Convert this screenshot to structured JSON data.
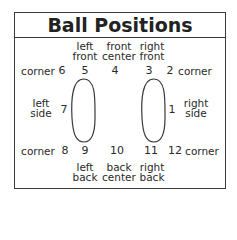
{
  "title": "Ball Positions",
  "top_labels": {
    "left_front": [
      "left",
      "front"
    ],
    "front_center": [
      "front",
      "center"
    ],
    "right_front": [
      "right",
      "front"
    ]
  },
  "bottom_labels": {
    "left_back": [
      "left",
      "back"
    ],
    "back_center": [
      "back",
      "center"
    ],
    "right_back": [
      "right",
      "back"
    ]
  },
  "side_labels": {
    "left_side": [
      "left",
      "side"
    ],
    "right_side": [
      "right",
      "side"
    ]
  },
  "corner_label": "corner",
  "positions": {
    "p1": "1",
    "p2": "2",
    "p3": "3",
    "p4": "4",
    "p5": "5",
    "p6": "6",
    "p7": "7",
    "p8": "8",
    "p9": "9",
    "p10": "10",
    "p11": "11",
    "p12": "12"
  },
  "colors": {
    "line": "#3a3a3a",
    "text": "#2a2a2a"
  }
}
